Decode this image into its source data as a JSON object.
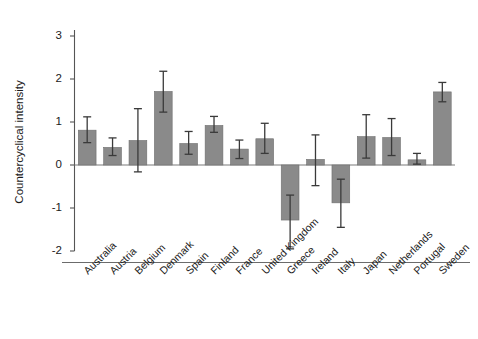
{
  "chart_data": {
    "type": "bar",
    "title": "",
    "xlabel": "",
    "ylabel": "Countercyclical intensity",
    "ylim": [
      -2.35,
      3.45
    ],
    "yticks": [
      -2,
      -1,
      0,
      1,
      2,
      3
    ],
    "ytick_labels": [
      "-2",
      "-1",
      "0",
      "1",
      "2",
      "3"
    ],
    "grid": false,
    "legend": "none",
    "error_bars": "vertical capped whiskers (confidence intervals)",
    "bar_color": "#8a8a8a",
    "bar_edge_color": "#6f6f6f",
    "error_bar_color": "#3a3a3a",
    "axis_color": "#555555",
    "zero_line": 0,
    "categories": [
      "Australia",
      "Austria",
      "Belgium",
      "Denmark",
      "Spain",
      "Finland",
      "France",
      "United Kingdom",
      "Greece",
      "Ireland",
      "Italy",
      "Japan",
      "Netherlands",
      "Portugal",
      "Sweden"
    ],
    "values": [
      0.81,
      0.41,
      0.57,
      1.71,
      0.5,
      0.92,
      0.37,
      0.61,
      -1.28,
      0.13,
      -0.88,
      0.66,
      0.64,
      0.12,
      1.7
    ],
    "err_low": [
      0.52,
      0.22,
      -0.16,
      1.23,
      0.25,
      0.76,
      0.15,
      0.27,
      -1.95,
      -0.48,
      -1.45,
      0.16,
      0.22,
      0.02,
      1.47
    ],
    "err_high": [
      1.12,
      0.63,
      1.31,
      2.18,
      0.78,
      1.13,
      0.58,
      0.97,
      -0.7,
      0.7,
      -0.33,
      1.17,
      1.08,
      0.27,
      1.92
    ]
  }
}
